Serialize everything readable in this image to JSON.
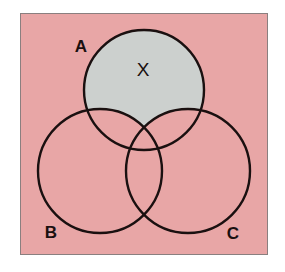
{
  "figure": {
    "kind": "venn-diagram",
    "panel": {
      "background_color": "#e8a6a6",
      "border_color": "#8a7f7f",
      "page_background": "#ffffff"
    },
    "stroke_color": "#1a1010",
    "shaded_region_color": "#ccd0ce"
  },
  "labels": {
    "set_a": "A",
    "set_b": "B",
    "set_c": "C",
    "mark": "X"
  },
  "chart_data": {
    "type": "diagram",
    "sets": [
      {
        "name": "A",
        "label": "A",
        "cx": 123,
        "cy": 76,
        "r": 60,
        "label_x": 60,
        "label_y": 38
      },
      {
        "name": "B",
        "label": "B",
        "cx": 79,
        "cy": 157,
        "r": 62,
        "label_x": 30,
        "label_y": 224
      },
      {
        "name": "C",
        "label": "C",
        "cx": 167,
        "cy": 157,
        "r": 62,
        "label_x": 212,
        "label_y": 225
      }
    ],
    "shaded_regions": [
      {
        "expression": "A \\ (B ∪ C)",
        "color": "#ccd0ce",
        "description": "Portion of circle A outside both B and C"
      }
    ],
    "annotations": [
      {
        "text": "X",
        "x": 122,
        "y": 62,
        "region": "A \\ (B ∪ C)"
      }
    ],
    "legend": null,
    "grid": false
  }
}
